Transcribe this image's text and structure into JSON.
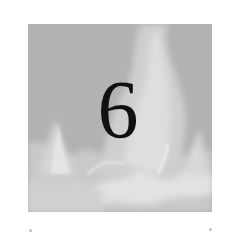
{
  "chapter": {
    "number": "6",
    "background": "flame-texture",
    "colors": {
      "plate": "#b4b4b4",
      "flame_light": "#e6e6e6",
      "numeral": "#111111",
      "page": "#ffffff"
    }
  }
}
